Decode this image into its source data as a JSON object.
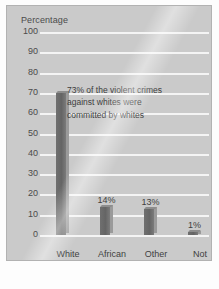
{
  "chart_data": {
    "type": "bar",
    "title": "",
    "xlabel": "Offenders",
    "ylabel": "Percentage",
    "categories": [
      "White",
      "African American",
      "Other",
      "Not known"
    ],
    "values": [
      70,
      14,
      13,
      1
    ],
    "data_labels": [
      "",
      "14%",
      "13%",
      "1%"
    ],
    "ylim": [
      0,
      100
    ],
    "ytick_labels": [
      "100",
      "90",
      "80",
      "70",
      "60",
      "50",
      "40",
      "30",
      "20",
      "10",
      "0"
    ],
    "ytick_values": [
      100,
      90,
      80,
      70,
      60,
      50,
      40,
      30,
      20,
      10,
      0
    ],
    "grid": true,
    "legend": "none",
    "annotations": [
      "73% of the violent crimes",
      "against whites were",
      "committed by whites"
    ],
    "colors": {
      "panel_background": "#cacaca",
      "gridline": "#f4f4f4",
      "bar_front": "#6b6b6b",
      "bar_side": "#9a9a9a",
      "text": "#3f3f3f",
      "page_background": "#ffffff"
    }
  },
  "category_lines": [
    [
      "White"
    ],
    [
      "African",
      "American"
    ],
    [
      "Other"
    ],
    [
      "Not",
      "known"
    ]
  ]
}
